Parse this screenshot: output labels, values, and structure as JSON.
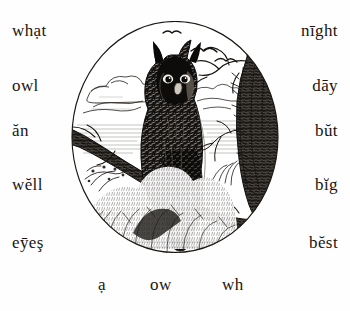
{
  "page": {
    "type": "reading-primer-lesson",
    "background_color": "#fefefe",
    "ink_color": "#1a1512"
  },
  "word_columns": {
    "left": [
      {
        "text": "whạt"
      },
      {
        "text": "owl"
      },
      {
        "text": "ăn"
      },
      {
        "text": "wĕll"
      },
      {
        "text": "eȳeş"
      }
    ],
    "right": [
      {
        "text": "nīght"
      },
      {
        "text": "dāy"
      },
      {
        "text": "bŭt"
      },
      {
        "text": "bĭg"
      },
      {
        "text": "bĕst"
      }
    ]
  },
  "bottom_row": [
    {
      "text": "ạ"
    },
    {
      "text": "ow"
    },
    {
      "text": "wh"
    }
  ],
  "illustration": {
    "name": "great-horned-owl-vignette",
    "subject": "great horned owl perched on a bare branch",
    "frame_shape": "circle",
    "style": "wood-engraving",
    "scene_elements": [
      "owl with ear tufts",
      "bare branch perch",
      "gnarled mossy tree trunk at right",
      "distant flying birds",
      "clouds over horizon",
      "shrubs and grasses at foot"
    ]
  }
}
